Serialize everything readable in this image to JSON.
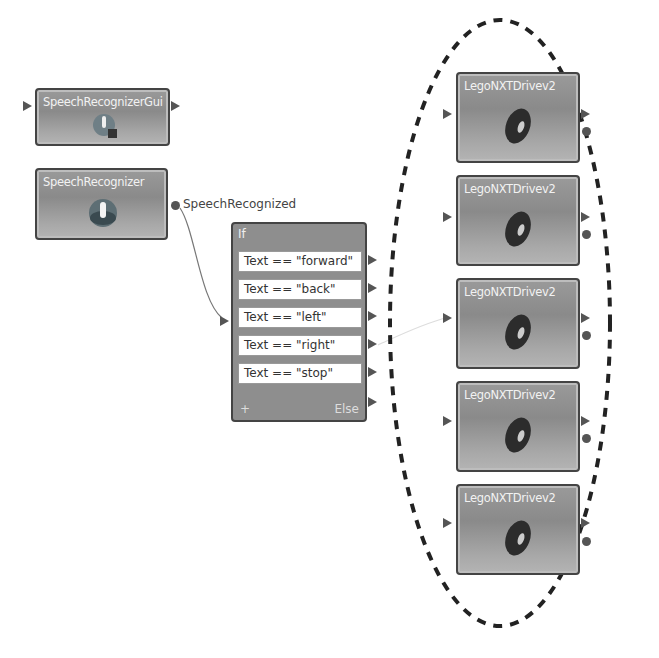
{
  "diagram": {
    "nodes": {
      "speech_gui": {
        "title": "SpeechRecognizerGui",
        "icon": "microphone-magnifier-icon"
      },
      "speech": {
        "title": "SpeechRecognizer",
        "icon": "microphone-icon",
        "event_label": "SpeechRecognized"
      },
      "if_block": {
        "title": "If",
        "conditions": [
          "Text == \"forward\"",
          "Text == \"back\"",
          "Text == \"left\"",
          "Text == \"right\"",
          "Text == \"stop\""
        ],
        "add_label": "+",
        "else_label": "Else"
      },
      "drives": [
        {
          "title": "LegoNXTDrivev2",
          "icon": "tire-icon"
        },
        {
          "title": "LegoNXTDrivev2",
          "icon": "tire-icon"
        },
        {
          "title": "LegoNXTDrivev2",
          "icon": "tire-icon"
        },
        {
          "title": "LegoNXTDrivev2",
          "icon": "tire-icon"
        },
        {
          "title": "LegoNXTDrivev2",
          "icon": "tire-icon"
        }
      ]
    },
    "colors": {
      "node_fill": "#8e8e8e",
      "node_border": "#444444",
      "port": "#555555",
      "ellipse": "#222222"
    }
  }
}
